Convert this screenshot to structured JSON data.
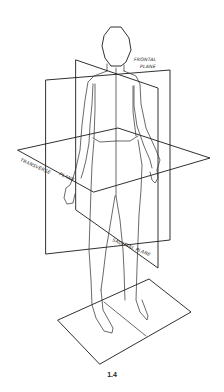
{
  "figure": {
    "caption": "1.4",
    "labels": {
      "frontal": [
        "FRONTAL",
        "PLANE"
      ],
      "transverse": "TRANSVERSE",
      "transverse_plane": "PLANE",
      "sagittal": "SAGITTAL PLANE"
    },
    "line_color": "#1a1a1a",
    "background": "#ffffff"
  }
}
